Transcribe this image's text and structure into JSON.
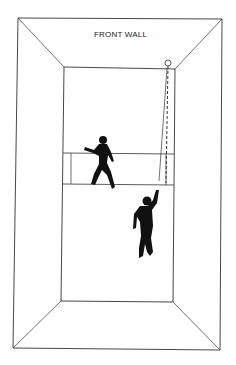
{
  "diagram": {
    "title_label": "FRONT WALL",
    "colors": {
      "stroke": "#333333",
      "figure": "#111111",
      "background": "#ffffff"
    },
    "elements": [
      "outer-court-box",
      "inner-back-wall",
      "service-line",
      "short-line",
      "service-box-line",
      "ball",
      "ball-path",
      "player-1",
      "player-2"
    ]
  }
}
